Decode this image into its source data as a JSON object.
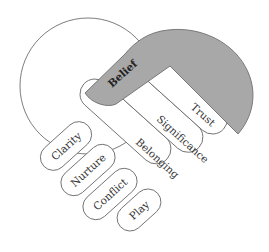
{
  "diagram": {
    "type": "handshake",
    "colors": {
      "accent_fill": "#a8a8a8",
      "outline": "#6e6e6e",
      "background": "#ffffff"
    },
    "right_hand": {
      "palm_label": "Belief",
      "fingers": [
        "Trust",
        "Significance",
        "Belonging"
      ]
    },
    "left_hand": {
      "fingers": [
        "Clarity",
        "Nurture",
        "Conflict",
        "Play"
      ]
    }
  }
}
